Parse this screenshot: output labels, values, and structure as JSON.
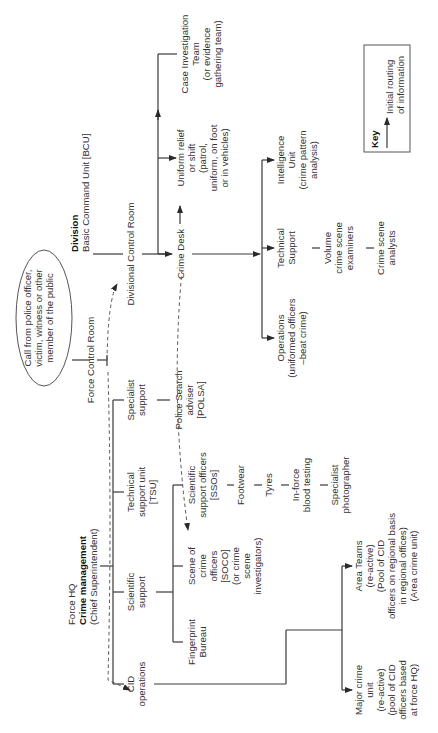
{
  "diagram": {
    "orientation": "rotated 90 degrees counter-clockwise",
    "colors": {
      "line": "#3a3a3a",
      "text": "#333333",
      "background": "#ffffff"
    },
    "call_source": {
      "lines": [
        "Call from police officer,",
        "victim, witness or other",
        "member of the public"
      ]
    },
    "force_control_room": "Force Control Room",
    "division": {
      "title": "Division",
      "subtitle": "Basic Command Unit [BCU]",
      "control_room": "Divisional Control Room",
      "crime_desk": "Crime Desk",
      "uniform_relief": [
        "Uniform relief",
        "or shift",
        "(patrol,",
        "uniform, on foot",
        "or in vehicles)"
      ],
      "case_investigation": [
        "Case Investigation",
        "Team",
        "(or evidence",
        "gathering team)"
      ],
      "operations": [
        "Operations",
        "(uniformed officers",
        "–beat crime)"
      ],
      "technical_support": [
        "Technical",
        "Support"
      ],
      "volume_examiners": [
        "Volume",
        "crime scene",
        "examiners"
      ],
      "crime_scene_analysts": [
        "Crime scene",
        "analysts"
      ],
      "intelligence_unit": [
        "Intelligence",
        "Unit",
        "(crime pattern",
        "analysis)"
      ]
    },
    "force_hq": {
      "title": "Force HQ",
      "subtitle": "Crime management",
      "rank": "(Chief Superintendent)",
      "cid_operations": [
        "CID",
        "operations"
      ],
      "scientific_support": [
        "Scientific",
        "support"
      ],
      "technical_support_unit": [
        "Technical",
        "support unit",
        "[TSU]"
      ],
      "specialist_support": [
        "Specialist",
        "support"
      ],
      "fingerprint_bureau": [
        "Fingerprint",
        "Bureau"
      ],
      "soco": [
        "Scene of",
        "crime",
        "officers",
        "[SOCO]",
        "(or crime",
        "scene",
        "investigators)"
      ],
      "sso": [
        "Scientific",
        "support officers",
        "[SSOs]"
      ],
      "footwear": "Footwear",
      "tyres": "Tyres",
      "blood_testing": [
        "In-force",
        "blood testing"
      ],
      "photographer": [
        "Specialist",
        "photographer"
      ],
      "polsa": [
        "Police Search",
        "adviser",
        "[POLSA]"
      ],
      "major_crime_unit": [
        "Major crime",
        "unit",
        "(re-active)",
        "(pool of CID",
        "officers based",
        "at force HQ)"
      ],
      "area_teams": [
        "Area Teams",
        "(re-active)",
        "(Pool of CID",
        "officers on regional basis",
        "in regional offices)",
        "(Area crime unit)"
      ]
    },
    "key": {
      "title": "Key",
      "lines": [
        "Initial routing",
        "of information"
      ]
    }
  }
}
